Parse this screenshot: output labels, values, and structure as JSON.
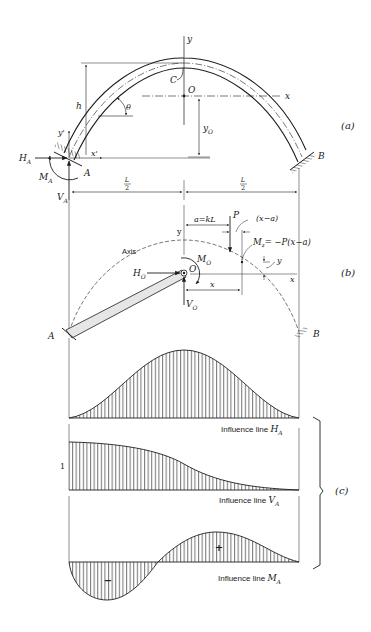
{
  "figure": {
    "colors": {
      "ink": "#1e1e1e",
      "fill_light": "#e6e6e6",
      "background": "#ffffff"
    },
    "part_a": {
      "label": "(a)",
      "axis_y": "y",
      "axis_x": "x",
      "origin": "O",
      "centroid_label": "C",
      "height_label": "h",
      "angle_label": "θ",
      "yo_label": "y",
      "yo_sub": "O",
      "local_y": "y'",
      "local_x": "x'",
      "support_a": "A",
      "support_b": "B",
      "ha_label": "H",
      "ha_sub": "A",
      "ma_label": "M",
      "ma_sub": "A",
      "va_label": "V",
      "va_sub": "A",
      "half_span_left": {
        "num": "L",
        "den": "2"
      },
      "half_span_right": {
        "num": "L",
        "den": "2"
      }
    },
    "part_b": {
      "label": "(b)",
      "axis_word": "Axis",
      "axis_y": "y",
      "axis_x": "x",
      "origin": "O",
      "load_label": "P",
      "load_position": "a=kL",
      "arm_label": "(x−a)",
      "moment_eq_m": "M",
      "moment_eq_sub": "z",
      "moment_eq_rhs": "= −P(x−a)",
      "ordinate_y": "y",
      "abscissa_x": "x",
      "ho_label": "H",
      "ho_sub": "O",
      "mo_label": "M",
      "mo_sub": "O",
      "vo_label": "V",
      "vo_sub": "O",
      "support_a": "A",
      "support_b": "B"
    },
    "part_c": {
      "label": "(c)",
      "influence_lines": [
        {
          "id": "HA",
          "caption": "Influence line ",
          "symbol": "H",
          "sub": "A"
        },
        {
          "id": "VA",
          "caption": "Influence line ",
          "symbol": "V",
          "sub": "A",
          "unit_value": "1"
        },
        {
          "id": "MA",
          "caption": "Influence line ",
          "symbol": "M",
          "sub": "A",
          "positive_sign": "+",
          "negative_sign": "−"
        }
      ]
    }
  }
}
